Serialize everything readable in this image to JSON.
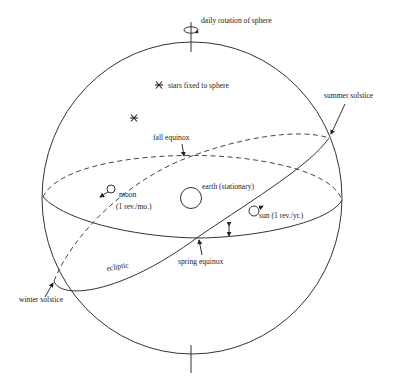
{
  "diagram": {
    "labels": {
      "rotation": "daily rotation of sphere",
      "stars": "stars fixed to sphere",
      "summer_solstice": "summer solstice",
      "fall_equinox": "fall equinox",
      "moon": "moon",
      "moon_rate": "(1 rev./mo.)",
      "earth": "earth (stationary)",
      "sun": "sun (1 rev./yr.)",
      "spring_equinox": "spring equinox",
      "ecliptic": "ecliptic",
      "winter_solstice": "winter solstice"
    },
    "icons": {
      "star": "asterisk-star-icon",
      "rotation": "rotation-arrow-icon"
    },
    "colors": {
      "line": "#333333",
      "background": "#ffffff"
    }
  }
}
